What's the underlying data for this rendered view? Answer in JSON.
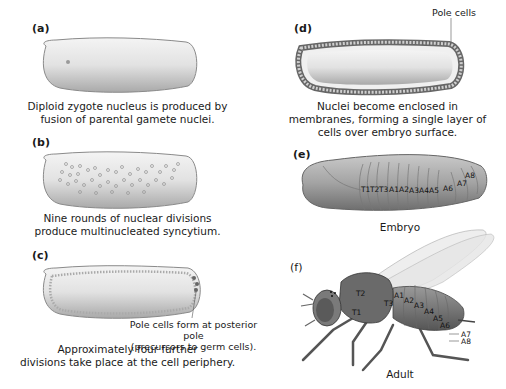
{
  "panels": {
    "a": {
      "label": "(a)",
      "caption_line1": "Diploid zygote nucleus is produced by",
      "caption_line2": "fusion of parental gamete nuclei."
    },
    "b": {
      "label": "(b)",
      "caption_line1": "Nine rounds of nuclear divisions",
      "caption_line2": "produce multinucleated syncytium."
    },
    "c": {
      "label": "(c)",
      "callout_line1": "Pole cells form at posterior pole",
      "callout_line2": "(precursors to germ cells).",
      "caption_line1": "Approximately four further",
      "caption_line2": "divisions take place at the cell periphery."
    },
    "d": {
      "label": "(d)",
      "callout": "Pole cells",
      "caption_line1": "Nuclei become enclosed in",
      "caption_line2": "membranes, forming a single layer of",
      "caption_line3": "cells over embryo surface."
    },
    "e": {
      "label": "(e)",
      "caption": "Embryo",
      "segments": [
        "T1",
        "T2",
        "T3",
        "A1",
        "A2",
        "A3",
        "A4",
        "A5",
        "A6",
        "A7",
        "A8"
      ]
    },
    "f": {
      "label": "(f)",
      "caption": "Adult",
      "segments": [
        "T1",
        "T2",
        "T3",
        "A1",
        "A2",
        "A3",
        "A4",
        "A5",
        "A6",
        "A7",
        "A8"
      ]
    }
  },
  "colors": {
    "egg_fill": "#d9d9d9",
    "egg_edge": "#8a8a8a",
    "nucleus": "#9a9a9a",
    "embryo_fill": "#a8a8a8",
    "fly_body": "#7a7a7a",
    "wing": "#e6e6e6"
  }
}
